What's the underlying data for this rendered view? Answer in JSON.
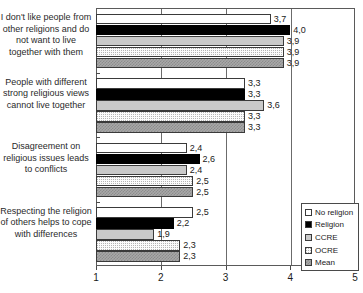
{
  "chart_data": {
    "type": "bar",
    "orientation": "horizontal",
    "title": "",
    "xlabel": "",
    "ylabel": "",
    "xlim": [
      1,
      5
    ],
    "xticks": [
      "1",
      "2",
      "3",
      "4",
      "5"
    ],
    "grid": true,
    "legend_position": "bottom-right",
    "categories": [
      "I don't like people from other religions and do not want to live together with them",
      "People with different strong religious views cannot live together",
      "Disagreement on religious issues leads to conflicts",
      "Respecting the religion of others helps to cope with differences"
    ],
    "series": [
      {
        "name": "No religion",
        "values": [
          3.7,
          3.3,
          2.4,
          2.5
        ],
        "labels": [
          "3,7",
          "3,3",
          "2,4",
          "2,5"
        ]
      },
      {
        "name": "Religion",
        "values": [
          4.0,
          3.3,
          2.6,
          2.2
        ],
        "labels": [
          "4,0",
          "3,3",
          "2,6",
          "2,2"
        ]
      },
      {
        "name": "CCRE",
        "values": [
          3.9,
          3.6,
          2.4,
          1.9
        ],
        "labels": [
          "3,9",
          "3,6",
          "2,4",
          "1,9"
        ]
      },
      {
        "name": "OCRE",
        "values": [
          3.9,
          3.3,
          2.5,
          2.3
        ],
        "labels": [
          "3,9",
          "3,3",
          "2,5",
          "2,3"
        ]
      },
      {
        "name": "Mean",
        "values": [
          3.9,
          3.3,
          2.5,
          2.3
        ],
        "labels": [
          "3,9",
          "3,3",
          "2,5",
          "2,3"
        ]
      }
    ]
  },
  "legend": {
    "items": [
      {
        "label": "No religion"
      },
      {
        "label": "Religion"
      },
      {
        "label": "CCRE"
      },
      {
        "label": "OCRE"
      },
      {
        "label": "Mean"
      }
    ]
  }
}
